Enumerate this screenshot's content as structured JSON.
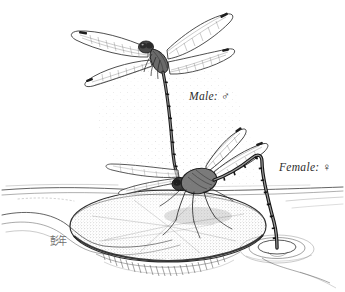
{
  "illustration": {
    "title": "Dragonfly mating pair over lily pad",
    "background_color": "#ffffff",
    "ink_color": "#2b2b2b",
    "labels": {
      "male": {
        "text": "Male:",
        "symbol": "♂"
      },
      "female": {
        "text": "Female:",
        "symbol": "♀"
      }
    },
    "signature": {
      "text": "彭年"
    },
    "subjects": [
      {
        "name": "male-dragonfly",
        "posture": "hovering upright, wings spread, abdomen descending",
        "wing_count": 4
      },
      {
        "name": "female-dragonfly",
        "posture": "perched, abdomen curved down to water surface ovipositing",
        "wing_count": 4
      }
    ],
    "scenery": [
      {
        "name": "lily-pad",
        "description": "stippled elliptical lily pad"
      },
      {
        "name": "water-surface",
        "description": "horizontal water line with shore"
      },
      {
        "name": "water-ripples",
        "description": "concentric ripples at abdomen tip"
      },
      {
        "name": "stipple-field",
        "description": "faint dotted shading around pair"
      }
    ]
  }
}
